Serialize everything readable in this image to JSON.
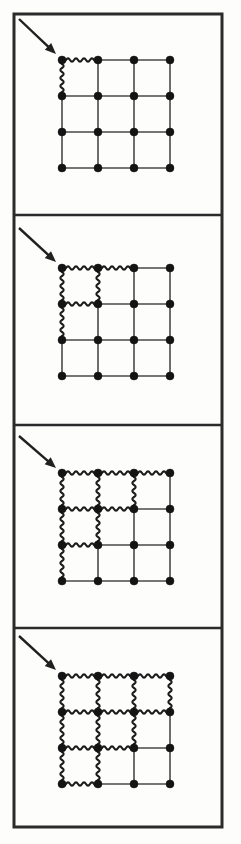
{
  "figure": {
    "canvas": {
      "width": 241,
      "height": 844,
      "background": "#fdfdfc"
    },
    "colors": {
      "frame": "#2b2b2b",
      "node": "#141414",
      "bond_plain": "#4a4a4a",
      "bond_wavy": "#1c1c1c",
      "arrow": "#202020"
    },
    "outer_frame": {
      "x": 14,
      "y": 14,
      "width": 208,
      "height": 813,
      "stroke_width": 3
    },
    "panel_dividers_y": [
      215,
      425,
      628
    ],
    "lattice": {
      "rows": 4,
      "cols": 4,
      "node_count": 16,
      "node_radius": 4.0,
      "spacing": 36
    },
    "arrow": {
      "label": "propagation-direction-arrow",
      "head_length": 11,
      "head_half_width": 4.6
    },
    "panels": [
      {
        "index": 1,
        "name": "panel-step-1",
        "origin": {
          "x": 62,
          "y": 60
        },
        "arrow": {
          "x1": 19,
          "y1": 19,
          "x2": 56,
          "y2": 54
        },
        "wavy_horizontal": [
          [
            0,
            0
          ]
        ],
        "wavy_vertical": [
          [
            0,
            0
          ]
        ]
      },
      {
        "index": 2,
        "name": "panel-step-2",
        "origin": {
          "x": 62,
          "y": 268
        },
        "arrow": {
          "x1": 19,
          "y1": 228,
          "x2": 56,
          "y2": 262
        },
        "wavy_horizontal": [
          [
            0,
            0
          ],
          [
            1,
            0
          ],
          [
            0,
            1
          ]
        ],
        "wavy_vertical": [
          [
            0,
            0
          ],
          [
            1,
            0
          ],
          [
            0,
            1
          ]
        ]
      },
      {
        "index": 3,
        "name": "panel-step-3",
        "origin": {
          "x": 62,
          "y": 473
        },
        "arrow": {
          "x1": 19,
          "y1": 436,
          "x2": 56,
          "y2": 468
        },
        "wavy_horizontal": [
          [
            0,
            0
          ],
          [
            1,
            0
          ],
          [
            2,
            0
          ],
          [
            0,
            1
          ],
          [
            1,
            1
          ],
          [
            0,
            2
          ]
        ],
        "wavy_vertical": [
          [
            0,
            0
          ],
          [
            1,
            0
          ],
          [
            2,
            0
          ],
          [
            0,
            1
          ],
          [
            1,
            1
          ],
          [
            0,
            2
          ]
        ]
      },
      {
        "index": 4,
        "name": "panel-step-4",
        "origin": {
          "x": 62,
          "y": 676
        },
        "arrow": {
          "x1": 19,
          "y1": 636,
          "x2": 56,
          "y2": 670
        },
        "wavy_horizontal": [
          [
            0,
            0
          ],
          [
            1,
            0
          ],
          [
            2,
            0
          ],
          [
            0,
            1
          ],
          [
            1,
            1
          ],
          [
            2,
            1
          ],
          [
            0,
            2
          ],
          [
            1,
            2
          ],
          [
            0,
            3
          ]
        ],
        "wavy_vertical": [
          [
            0,
            0
          ],
          [
            1,
            0
          ],
          [
            2,
            0
          ],
          [
            3,
            0
          ],
          [
            0,
            1
          ],
          [
            1,
            1
          ],
          [
            2,
            1
          ],
          [
            0,
            2
          ],
          [
            1,
            2
          ]
        ]
      }
    ]
  }
}
